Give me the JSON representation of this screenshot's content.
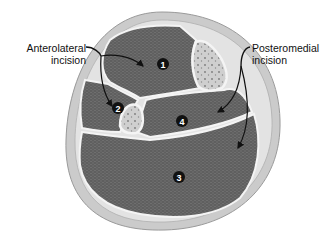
{
  "figure": {
    "type": "cross-section diagram of lower leg compartments",
    "labels": {
      "anterolateral": {
        "line1": "Anterolateral",
        "line2": "incision"
      },
      "posteromedial": {
        "line1": "Posteromedial",
        "line2": "incision"
      }
    },
    "compartments": [
      {
        "id": "1",
        "name": "anterior"
      },
      {
        "id": "2",
        "name": "lateral"
      },
      {
        "id": "3",
        "name": "superficial-posterior"
      },
      {
        "id": "4",
        "name": "deep-posterior"
      }
    ],
    "colors": {
      "skin": "#c9c9c9",
      "fat": "#e2e2e2",
      "muscle": "#5e5e5e",
      "bone": "#d6d6d6",
      "fascia": "#f5f5f5",
      "marker": "#111111"
    }
  }
}
